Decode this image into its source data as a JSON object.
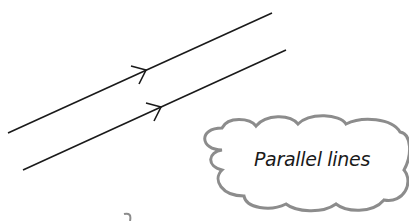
{
  "diagram": {
    "title": "Parallel lines",
    "colors": {
      "line": "#1a1a1a",
      "cloud_stroke": "#8c8c8c",
      "background": "#ffffff"
    },
    "lines": [
      {
        "id": "line-1",
        "x1": 8,
        "y1": 133,
        "x2": 272,
        "y2": 13,
        "arrow_at": [
          146,
          70
        ]
      },
      {
        "id": "line-2",
        "x1": 23,
        "y1": 170,
        "x2": 286,
        "y2": 50,
        "arrow_at": [
          161,
          107
        ]
      }
    ],
    "cloud": {
      "label": "Parallel lines"
    }
  }
}
